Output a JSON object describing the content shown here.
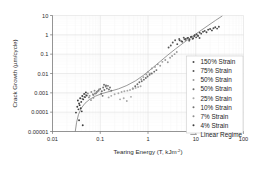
{
  "chart_data": {
    "type": "scatter",
    "title": "",
    "xlabel": "Tearing Energy (T, kJm-2)",
    "xlabel_main": "Tearing Energy (T, kJm",
    "xlabel_sup": "-2",
    "xlabel_tail": ")",
    "ylabel": "Crack Growth (µm/cycle)",
    "xscale": "log",
    "yscale": "log",
    "xlim": [
      0.01,
      100
    ],
    "ylim": [
      1e-05,
      10
    ],
    "xticks": [
      "0.01",
      "0.1",
      "1",
      "10",
      "100"
    ],
    "xtick_values": [
      0.01,
      0.1,
      1,
      10,
      100
    ],
    "yticks": [
      "0.00001",
      "0.0001",
      "0.001",
      "0.01",
      "0.1",
      "1",
      "10"
    ],
    "ytick_values": [
      1e-05,
      0.0001,
      0.001,
      0.01,
      0.1,
      1,
      10
    ],
    "grid": true,
    "legend_position": "lower-right",
    "legend": [
      {
        "label": "150% Strain",
        "marker": "dot",
        "color": "#4a4a4a"
      },
      {
        "label": "75% Strain",
        "marker": "dot",
        "color": "#555555"
      },
      {
        "label": "50% Strain",
        "marker": "dot",
        "color": "#9a9a9a"
      },
      {
        "label": "50% Strain",
        "marker": "dot",
        "color": "#6a6a6a"
      },
      {
        "label": "25% Strain",
        "marker": "dot",
        "color": "#a8a8a8"
      },
      {
        "label": "10% Strain",
        "marker": "dot",
        "color": "#707070"
      },
      {
        "label": "7% Strain",
        "marker": "dot",
        "color": "#8e8e8e"
      },
      {
        "label": "4% Strain",
        "marker": "dot",
        "color": "#3d3d3d"
      },
      {
        "label": "Linear Regime",
        "marker": "line",
        "color": "#777777"
      }
    ],
    "series": [
      {
        "name": "150% Strain",
        "color": "#4a4a4a",
        "points": [
          [
            6.2,
            0.62
          ],
          [
            6.9,
            0.7
          ],
          [
            7.4,
            0.58
          ],
          [
            8.1,
            0.8
          ],
          [
            8.8,
            0.66
          ],
          [
            9.5,
            0.95
          ],
          [
            10.4,
            1.05
          ],
          [
            11.2,
            0.88
          ],
          [
            12.1,
            1.3
          ],
          [
            13.0,
            1.15
          ],
          [
            14.2,
            1.45
          ],
          [
            15.4,
            1.6
          ],
          [
            16.8,
            1.35
          ],
          [
            18.2,
            1.85
          ],
          [
            20.0,
            2.0
          ],
          [
            21.8,
            1.7
          ],
          [
            23.5,
            2.2
          ],
          [
            25.6,
            2.45
          ],
          [
            28.0,
            2.1
          ],
          [
            30.5,
            2.6
          ],
          [
            4.6,
            0.52
          ],
          [
            5.2,
            0.44
          ],
          [
            5.8,
            0.6
          ]
        ]
      },
      {
        "name": "75% Strain",
        "color": "#555555",
        "points": [
          [
            3.3,
            0.4
          ],
          [
            3.7,
            0.52
          ],
          [
            4.1,
            0.33
          ],
          [
            4.5,
            0.61
          ],
          [
            5.0,
            0.47
          ],
          [
            5.6,
            0.72
          ],
          [
            6.1,
            0.55
          ],
          [
            6.7,
            0.68
          ],
          [
            7.3,
            0.5
          ],
          [
            7.9,
            0.78
          ],
          [
            8.6,
            0.63
          ],
          [
            9.3,
            0.85
          ],
          [
            3.0,
            0.28
          ],
          [
            2.7,
            0.22
          ],
          [
            10.2,
            0.74
          ],
          [
            11.0,
            0.92
          ],
          [
            12.0,
            0.69
          ]
        ]
      },
      {
        "name": "50% Strain",
        "color": "#9a9a9a",
        "points": [
          [
            1.0,
            0.012
          ],
          [
            1.2,
            0.018
          ],
          [
            1.4,
            0.022
          ],
          [
            1.6,
            0.03
          ],
          [
            1.8,
            0.025
          ],
          [
            2.0,
            0.04
          ],
          [
            2.3,
            0.05
          ],
          [
            2.6,
            0.038
          ],
          [
            2.9,
            0.065
          ],
          [
            1.1,
            0.01
          ],
          [
            0.92,
            0.009
          ],
          [
            0.8,
            0.0065
          ],
          [
            0.72,
            0.005
          ],
          [
            3.2,
            0.08
          ],
          [
            3.6,
            0.1
          ],
          [
            4.0,
            0.13
          ]
        ]
      },
      {
        "name": "50% Strain (b)",
        "color": "#6a6a6a",
        "points": [
          [
            0.6,
            0.0028
          ],
          [
            0.66,
            0.0035
          ],
          [
            0.74,
            0.004
          ],
          [
            0.82,
            0.0048
          ],
          [
            0.9,
            0.0058
          ],
          [
            0.98,
            0.007
          ],
          [
            1.08,
            0.0085
          ],
          [
            0.54,
            0.0022
          ],
          [
            0.48,
            0.0017
          ],
          [
            1.2,
            0.01
          ],
          [
            1.35,
            0.0125
          ],
          [
            1.5,
            0.015
          ]
        ]
      },
      {
        "name": "25% Strain",
        "color": "#a8a8a8",
        "points": [
          [
            0.2,
            0.00085
          ],
          [
            0.24,
            0.00095
          ],
          [
            0.28,
            0.0011
          ],
          [
            0.32,
            0.0012
          ],
          [
            0.37,
            0.0013
          ],
          [
            0.42,
            0.0014
          ],
          [
            0.48,
            0.0016
          ],
          [
            0.55,
            0.0018
          ],
          [
            0.17,
            0.0007
          ],
          [
            0.15,
            0.00058
          ],
          [
            0.62,
            0.002
          ],
          [
            0.7,
            0.0022
          ],
          [
            0.26,
            0.00046
          ],
          [
            0.31,
            0.00052
          ],
          [
            0.36,
            0.00038
          ],
          [
            0.44,
            0.00062
          ]
        ]
      },
      {
        "name": "10% Strain",
        "color": "#707070",
        "points": [
          [
            0.085,
            0.0011
          ],
          [
            0.092,
            0.0013
          ],
          [
            0.1,
            0.0016
          ],
          [
            0.108,
            0.0012
          ],
          [
            0.115,
            0.0019
          ],
          [
            0.122,
            0.0014
          ],
          [
            0.13,
            0.0021
          ],
          [
            0.138,
            0.0017
          ],
          [
            0.145,
            0.0023
          ],
          [
            0.152,
            0.0015
          ],
          [
            0.16,
            0.0019
          ],
          [
            0.17,
            0.0013
          ],
          [
            0.078,
            0.00092
          ],
          [
            0.072,
            0.00078
          ],
          [
            0.12,
            0.0026
          ],
          [
            0.132,
            0.0024
          ],
          [
            0.105,
            0.0009
          ],
          [
            0.112,
            0.0007
          ]
        ]
      },
      {
        "name": "7% Strain",
        "color": "#8e8e8e",
        "points": [
          [
            0.05,
            0.00078
          ],
          [
            0.055,
            0.00092
          ],
          [
            0.06,
            0.0007
          ],
          [
            0.065,
            0.0011
          ],
          [
            0.07,
            0.00085
          ],
          [
            0.076,
            0.0013
          ],
          [
            0.082,
            0.00096
          ],
          [
            0.088,
            0.0012
          ],
          [
            0.046,
            0.00062
          ],
          [
            0.042,
            0.0005
          ],
          [
            0.094,
            0.0015
          ],
          [
            0.058,
            0.00058
          ],
          [
            0.064,
            0.00042
          ],
          [
            0.072,
            0.00055
          ]
        ]
      },
      {
        "name": "4% Strain",
        "color": "#3d3d3d",
        "points": [
          [
            0.034,
            0.0004
          ],
          [
            0.036,
            0.00028
          ],
          [
            0.038,
            0.00052
          ],
          [
            0.04,
            0.00034
          ],
          [
            0.042,
            0.00068
          ],
          [
            0.044,
            0.00046
          ],
          [
            0.046,
            0.00088
          ],
          [
            0.048,
            0.0006
          ],
          [
            0.033,
            0.00019
          ],
          [
            0.035,
            0.00014
          ],
          [
            0.037,
            0.00023
          ],
          [
            0.039,
            0.00016
          ],
          [
            0.05,
            0.00105
          ],
          [
            0.052,
            0.00072
          ],
          [
            0.041,
            0.00011
          ],
          [
            0.031,
            9.5e-05
          ],
          [
            0.043,
            2.1e-05
          ],
          [
            0.036,
            3.8e-05
          ]
        ]
      }
    ],
    "fit_line": {
      "name": "Linear Regime",
      "color": "#777777",
      "points": [
        [
          0.03,
          1e-05
        ],
        [
          0.032,
          3e-05
        ],
        [
          0.035,
          7.5e-05
        ],
        [
          0.04,
          0.00016
        ],
        [
          0.048,
          0.00029
        ],
        [
          0.06,
          0.00046
        ],
        [
          0.08,
          0.00068
        ],
        [
          0.11,
          0.00092
        ],
        [
          0.16,
          0.0012
        ],
        [
          0.24,
          0.0016
        ],
        [
          0.36,
          0.0024
        ],
        [
          0.55,
          0.0042
        ],
        [
          0.8,
          0.008
        ],
        [
          1.2,
          0.018
        ],
        [
          1.8,
          0.042
        ],
        [
          2.6,
          0.09
        ],
        [
          3.8,
          0.19
        ],
        [
          5.5,
          0.38
        ],
        [
          8.0,
          0.75
        ],
        [
          12.0,
          1.5
        ],
        [
          18.0,
          3.0
        ],
        [
          26.0,
          5.6
        ],
        [
          36.0,
          9.5
        ]
      ]
    }
  }
}
